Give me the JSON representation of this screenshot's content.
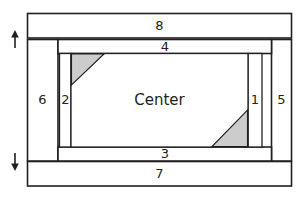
{
  "diagram": {
    "type": "schematic-block-diagram",
    "title": "",
    "colors": {
      "stroke": "#231f20",
      "panel_fill": "#ffffff",
      "triangle_fill": "#cccccc",
      "background": "#ffffff"
    },
    "center": {
      "label": "Center"
    },
    "zones": [
      {
        "id": "zone-8",
        "label": "8",
        "position": "top-outer-bar",
        "x": 159.5,
        "y": 25.5
      },
      {
        "id": "zone-4",
        "label": "4",
        "position": "top-inner-bar",
        "x": 165.0,
        "y": 46.5
      },
      {
        "id": "zone-6",
        "label": "6",
        "position": "left-outer-panel",
        "x": 42.5,
        "y": 100.0
      },
      {
        "id": "zone-2",
        "label": "2",
        "position": "left-inner-panel",
        "x": 65.5,
        "y": 100.0
      },
      {
        "id": "zone-1",
        "label": "1",
        "position": "right-inner-panel",
        "x": 255.0,
        "y": 100.0
      },
      {
        "id": "zone-5",
        "label": "5",
        "position": "right-outer-panel",
        "x": 281.5,
        "y": 100.0
      },
      {
        "id": "zone-3",
        "label": "3",
        "position": "bottom-inner-bar",
        "x": 165.0,
        "y": 153.5
      },
      {
        "id": "zone-7",
        "label": "7",
        "position": "bottom-outer-bar",
        "x": 159.5,
        "y": 173.5
      }
    ],
    "triangles": [
      {
        "id": "triangle-top-left",
        "points": "71,54 104,54 71,85",
        "fill": "#cccccc"
      },
      {
        "id": "triangle-bottom-right",
        "points": "248,110 248,147 212,147",
        "fill": "#cccccc"
      }
    ],
    "arrows": [
      {
        "id": "arrow-up",
        "direction": "up",
        "x": 15,
        "y_top": 31,
        "y_bottom": 48
      },
      {
        "id": "arrow-down",
        "direction": "down",
        "x": 15,
        "y_top": 154,
        "y_bottom": 171
      }
    ]
  }
}
